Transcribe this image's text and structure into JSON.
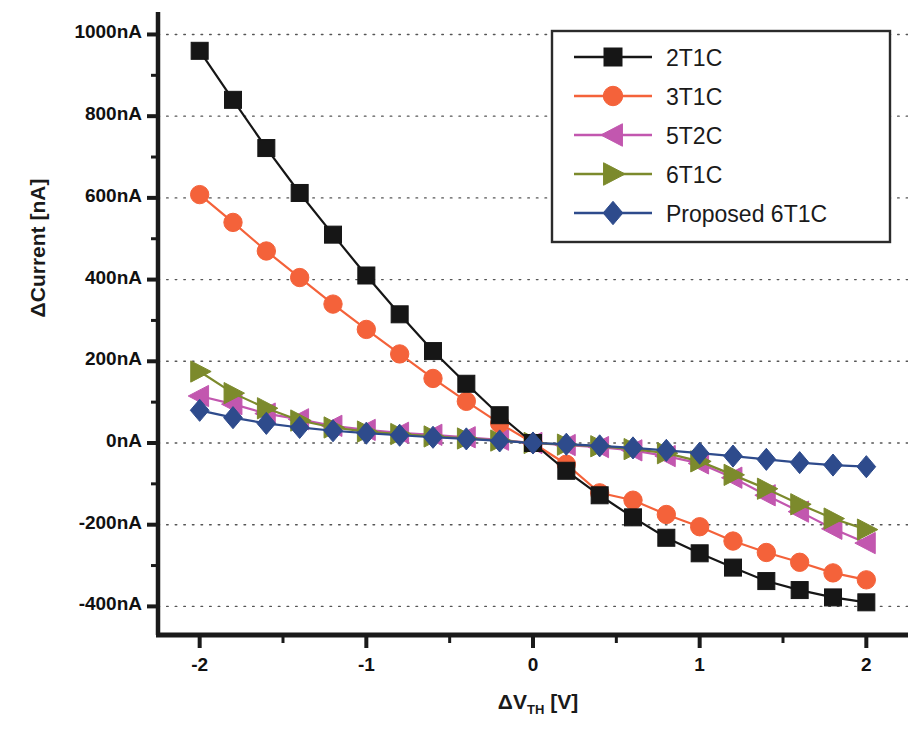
{
  "chart_data": {
    "type": "line",
    "title": "",
    "xlabel": "ΔV_TH [V]",
    "xlabel_main": "ΔV",
    "xlabel_sub": "TH",
    "xlabel_unit": " [V]",
    "ylabel": "ΔCurrent [nA]",
    "xlim": [
      -2.25,
      2.25
    ],
    "ylim": [
      -470,
      1055
    ],
    "grid": true,
    "grid_style": "dotted-horizontal",
    "legend_position": "top-right",
    "x_major_ticks": [
      -2,
      -1,
      0,
      1,
      2
    ],
    "x_major_tick_labels": [
      "-2",
      "-1",
      "0",
      "1",
      "2"
    ],
    "x_minor_ticks": [
      -1.5,
      -0.5,
      0.5,
      1.5
    ],
    "y_major_ticks": [
      1000,
      800,
      600,
      400,
      200,
      0,
      -200,
      -400
    ],
    "y_major_tick_labels": [
      "1000nA",
      "800nA",
      "600nA",
      "400nA",
      "200nA",
      "0nA",
      "-200nA",
      "-400nA"
    ],
    "y_minor_ticks": [
      900,
      700,
      500,
      300,
      100,
      -100,
      -300
    ],
    "x": [
      -2.0,
      -1.8,
      -1.6,
      -1.4,
      -1.2,
      -1.0,
      -0.8,
      -0.6,
      -0.4,
      -0.2,
      0.0,
      0.2,
      0.4,
      0.6,
      0.8,
      1.0,
      1.2,
      1.4,
      1.6,
      1.8,
      2.0
    ],
    "series": [
      {
        "name": "2T1C",
        "color": "#161616",
        "marker": "square",
        "values": [
          960,
          840,
          722,
          612,
          510,
          410,
          315,
          225,
          145,
          68,
          0,
          -68,
          -128,
          -182,
          -232,
          -270,
          -305,
          -338,
          -360,
          -378,
          -390
        ]
      },
      {
        "name": "3T1C",
        "color": "#F4623A",
        "marker": "circle",
        "values": [
          608,
          540,
          470,
          405,
          340,
          278,
          218,
          158,
          102,
          48,
          0,
          -52,
          -122,
          -140,
          -175,
          -205,
          -240,
          -268,
          -292,
          -318,
          -335
        ]
      },
      {
        "name": "5T2C",
        "color": "#C257AF",
        "marker": "triangle-left",
        "values": [
          115,
          95,
          72,
          58,
          42,
          32,
          25,
          20,
          14,
          8,
          0,
          -5,
          -10,
          -18,
          -32,
          -50,
          -85,
          -128,
          -168,
          -210,
          -245
        ]
      },
      {
        "name": "6T1C",
        "color": "#7C8A2C",
        "marker": "triangle-right",
        "values": [
          175,
          122,
          85,
          55,
          38,
          28,
          22,
          16,
          11,
          6,
          0,
          -4,
          -8,
          -15,
          -25,
          -45,
          -78,
          -112,
          -150,
          -185,
          -212
        ]
      },
      {
        "name": "Proposed 6T1C",
        "color": "#2E4B8C",
        "marker": "diamond",
        "values": [
          80,
          62,
          48,
          38,
          30,
          24,
          19,
          14,
          10,
          5,
          0,
          -3,
          -7,
          -12,
          -18,
          -25,
          -32,
          -40,
          -48,
          -54,
          -58
        ]
      }
    ]
  },
  "legend": {
    "entries": [
      {
        "label": "2T1C"
      },
      {
        "label": "3T1C"
      },
      {
        "label": "5T2C"
      },
      {
        "label": "6T1C"
      },
      {
        "label": "Proposed 6T1C"
      }
    ]
  }
}
